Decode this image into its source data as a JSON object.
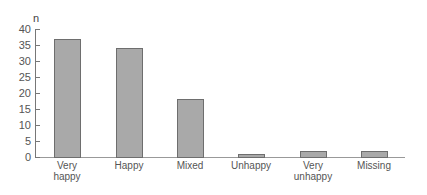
{
  "chart_data": {
    "type": "bar",
    "title": "",
    "xlabel": "",
    "ylabel": "n",
    "ylim": [
      0,
      40
    ],
    "yticks": [
      0,
      5,
      10,
      15,
      20,
      25,
      30,
      35,
      40
    ],
    "grid": false,
    "legend": null,
    "categories": [
      "Very\nhappy",
      "Happy",
      "Mixed",
      "Unhappy",
      "Very\nunhappy",
      "Missing"
    ],
    "values": [
      37,
      34,
      18,
      1,
      2,
      2
    ],
    "bar_color": "#a9a9a9",
    "bar_edge_color": "#6e6e6e"
  }
}
